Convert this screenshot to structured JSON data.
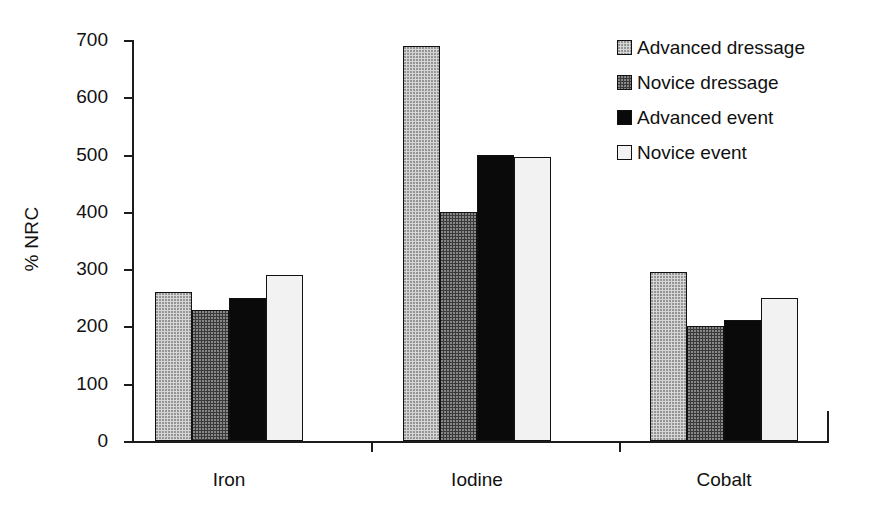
{
  "chart_data": {
    "type": "bar",
    "title": "",
    "subtitle": "",
    "xlabel": "",
    "ylabel": "% NRC",
    "categories": [
      "Iron",
      "Iodine",
      "Cobalt"
    ],
    "series": [
      {
        "name": "Advanced dressage",
        "color": "#d6d6d6",
        "values": [
          260,
          690,
          295
        ]
      },
      {
        "name": "Novice dressage",
        "color": "#3a3a3a",
        "values": [
          228,
          400,
          200
        ]
      },
      {
        "name": "Advanced event",
        "color": "#0a0a0a",
        "values": [
          250,
          500,
          211
        ]
      },
      {
        "name": "Novice event",
        "color": "#f2f2f2",
        "values": [
          289,
          495,
          250
        ]
      }
    ],
    "ylim": [
      0,
      700
    ],
    "yticks": [
      0,
      100,
      200,
      300,
      400,
      500,
      600,
      700
    ],
    "ytick_labels": [
      "0",
      "100",
      "200",
      "300",
      "400",
      "500",
      "600",
      "700"
    ],
    "grid": false,
    "legend_position": "right-top"
  },
  "legend": {
    "items": [
      {
        "label": "Advanced dressage",
        "swatch": "advanced-dressage"
      },
      {
        "label": "Novice dressage",
        "swatch": "novice-dressage"
      },
      {
        "label": "Advanced event",
        "swatch": "advanced-event"
      },
      {
        "label": "Novice event",
        "swatch": "novice-event"
      }
    ]
  }
}
